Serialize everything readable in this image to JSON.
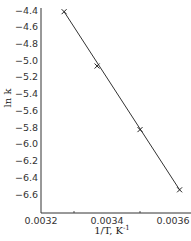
{
  "chart_data": {
    "type": "line",
    "title": "",
    "xlabel": "1/T, K",
    "xlabel_superscript": "-1",
    "ylabel": "ln k",
    "xlim": [
      0.0032,
      0.00366
    ],
    "ylim": [
      -6.8,
      -4.4
    ],
    "x_ticks": [
      "0.0032",
      "0.0034",
      "0.0036"
    ],
    "x_tick_values": [
      0.0032,
      0.0034,
      0.0036
    ],
    "y_ticks": [
      "-4.4",
      "-4.6",
      "-4.8",
      "-5.0",
      "-5.2",
      "-5.4",
      "-5.6",
      "-5.8",
      "-6.0",
      "-6.2",
      "-6.4",
      "-6.6"
    ],
    "y_tick_values": [
      -4.4,
      -4.6,
      -4.8,
      -5.0,
      -5.2,
      -5.4,
      -5.6,
      -5.8,
      -6.0,
      -6.2,
      -6.4,
      -6.6
    ],
    "grid": false,
    "legend": null,
    "series": [
      {
        "name": "ln k vs 1/T",
        "marker": "x",
        "x": [
          0.00327,
          0.00337,
          0.0035,
          0.00362
        ],
        "y": [
          -4.42,
          -5.07,
          -5.83,
          -6.55
        ]
      }
    ],
    "fit_line": {
      "x": [
        0.00327,
        0.00362
      ],
      "y": [
        -4.42,
        -6.55
      ]
    },
    "colors": {
      "line": "#333333",
      "axis": "#333333"
    }
  }
}
